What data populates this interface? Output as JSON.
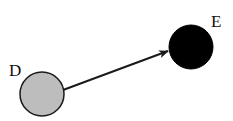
{
  "diagram": {
    "nodes": [
      {
        "id": "D",
        "label": "D",
        "fill": "#bdbdbd",
        "stroke": "#1a1a1a",
        "cx": 42,
        "cy": 94,
        "r": 22
      },
      {
        "id": "E",
        "label": "E",
        "fill": "#000000",
        "stroke": "#000000",
        "cx": 191,
        "cy": 47,
        "r": 22
      }
    ],
    "edges": [
      {
        "from": "D",
        "to": "E",
        "directed": true,
        "color": "#1a1a1a"
      }
    ]
  }
}
